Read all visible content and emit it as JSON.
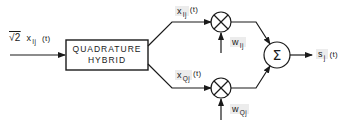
{
  "diagram": {
    "type": "block-diagram",
    "title": "",
    "input": {
      "label_prefix": "√2",
      "label_var": "x",
      "label_sub": "Ij",
      "label_suffix": "(t)"
    },
    "hybrid_block": {
      "line1": "QUADRATURE",
      "line2": "HYBRID"
    },
    "branches": {
      "in_phase": {
        "signal_var": "x",
        "signal_sub": "Ij",
        "signal_suffix": "(t)",
        "weight_var": "w",
        "weight_sub": "Ij",
        "operator": "multiply"
      },
      "quadrature": {
        "signal_var": "x",
        "signal_sub": "Qj",
        "signal_suffix": "(t)",
        "weight_var": "w",
        "weight_sub": "Qj",
        "operator": "multiply"
      }
    },
    "summer": {
      "symbol": "Σ"
    },
    "output": {
      "label_var": "s",
      "label_sub": "j",
      "label_suffix": "(t)"
    },
    "colors": {
      "stroke": "#1a1a1a",
      "background": "#ffffff",
      "label_shade": "#ececec"
    }
  }
}
